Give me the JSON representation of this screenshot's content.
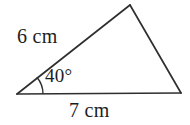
{
  "figure": {
    "kind": "triangle-diagram",
    "background_color": "#ffffff",
    "stroke_color": "#2f2f2f",
    "text_color": "#1d1d1d",
    "labels": {
      "side_a": "6 cm",
      "side_b": "7 cm",
      "angle": "40°"
    },
    "geometry": {
      "vertices": {
        "left": [
          17,
          94
        ],
        "apex": [
          130,
          5
        ],
        "right": [
          181,
          93
        ]
      },
      "angle_arc": {
        "center": [
          17,
          94
        ],
        "radius": 26,
        "start_deg": 0,
        "sweep_deg": 40
      },
      "path": "M17,94 L130,5 L181,93 Z"
    }
  },
  "chart_data": {
    "type": "diagram",
    "title": "",
    "shape": "triangle",
    "sides": [
      {
        "name": "left-side",
        "label": "6 cm",
        "value": 6,
        "unit": "cm",
        "from": "left",
        "to": "apex"
      },
      {
        "name": "base",
        "label": "7 cm",
        "value": 7,
        "unit": "cm",
        "from": "left",
        "to": "right"
      },
      {
        "name": "right-side",
        "label": "",
        "value": null,
        "unit": "",
        "from": "apex",
        "to": "right"
      }
    ],
    "angles": [
      {
        "name": "included-angle",
        "label": "40°",
        "value": 40,
        "unit": "deg",
        "at_vertex": "left"
      }
    ],
    "annotations": [
      "6 cm",
      "40°",
      "7 cm"
    ]
  }
}
